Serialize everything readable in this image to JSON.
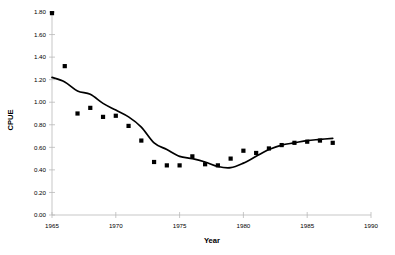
{
  "chart_data": {
    "type": "scatter",
    "title": "",
    "xlabel": "Year",
    "ylabel": "CPUE",
    "xlim": [
      1965,
      1990
    ],
    "ylim": [
      0.0,
      1.8
    ],
    "grid": false,
    "legend": "none",
    "x_ticks": [
      "1965",
      "1970",
      "1975",
      "1980",
      "1985",
      "1990"
    ],
    "x_tick_values": [
      1965,
      1970,
      1975,
      1980,
      1985,
      1990
    ],
    "y_ticks": [
      "0.00",
      "0.20",
      "0.40",
      "0.60",
      "0.80",
      "1.00",
      "1.20",
      "1.40",
      "1.60",
      "1.80"
    ],
    "y_tick_values": [
      0.0,
      0.2,
      0.4,
      0.6,
      0.8,
      1.0,
      1.2,
      1.4,
      1.6,
      1.8
    ],
    "series": [
      {
        "name": "CPUE observations",
        "type": "scatter",
        "marker": "square",
        "color": "#000000",
        "x": [
          1965,
          1966,
          1967,
          1968,
          1969,
          1970,
          1971,
          1972,
          1973,
          1974,
          1975,
          1976,
          1977,
          1978,
          1979,
          1980,
          1981,
          1982,
          1983,
          1984,
          1985,
          1986,
          1987
        ],
        "values": [
          1.79,
          1.32,
          0.9,
          0.95,
          0.87,
          0.88,
          0.79,
          0.66,
          0.47,
          0.44,
          0.44,
          0.52,
          0.45,
          0.44,
          0.5,
          0.57,
          0.55,
          0.59,
          0.62,
          0.64,
          0.65,
          0.66,
          0.64
        ]
      },
      {
        "name": "Fitted trend",
        "type": "line",
        "color": "#000000",
        "x": [
          1965,
          1966,
          1967,
          1968,
          1969,
          1970,
          1971,
          1972,
          1973,
          1974,
          1975,
          1976,
          1977,
          1978,
          1979,
          1980,
          1981,
          1982,
          1983,
          1984,
          1985,
          1986,
          1987
        ],
        "values": [
          1.22,
          1.18,
          1.1,
          1.07,
          0.99,
          0.93,
          0.87,
          0.78,
          0.64,
          0.58,
          0.52,
          0.5,
          0.47,
          0.43,
          0.42,
          0.46,
          0.52,
          0.58,
          0.62,
          0.64,
          0.66,
          0.67,
          0.68
        ]
      }
    ]
  }
}
